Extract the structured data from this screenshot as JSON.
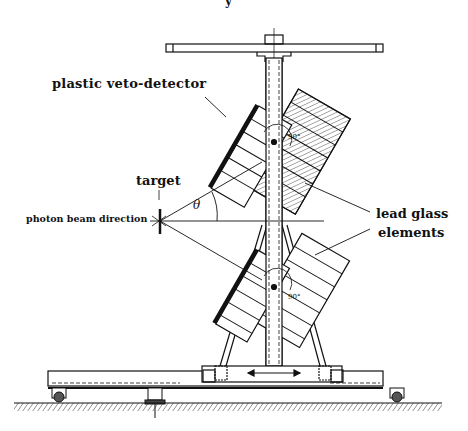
{
  "figure": {
    "type": "technical drawing"
  },
  "labels": {
    "page_fragment": "y",
    "veto": "plastic veto-detector",
    "target": "target",
    "beam": "photon beam direction",
    "lead_line1": "lead glass",
    "lead_line2": "elements",
    "theta": "θ",
    "angle_upper": "90°",
    "angle_lower": "90°"
  },
  "colors": {
    "ink": "#111111",
    "background": "#ffffff"
  }
}
